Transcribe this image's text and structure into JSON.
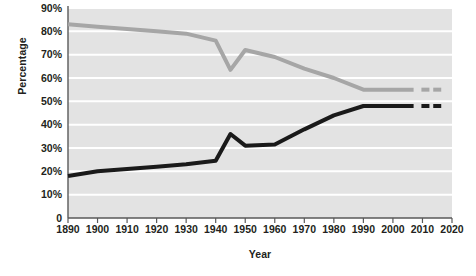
{
  "chart_data": {
    "type": "line",
    "title": "",
    "xlabel": "Year",
    "ylabel": "Percentage",
    "xlim": [
      1890,
      2020
    ],
    "ylim": [
      0,
      90
    ],
    "grid": true,
    "legend_position": "inline-labels",
    "y_ticks": [
      "0",
      "10%",
      "20%",
      "30%",
      "40%",
      "50%",
      "60%",
      "70%",
      "80%",
      "90%"
    ],
    "y_tick_values": [
      0,
      10,
      20,
      30,
      40,
      50,
      60,
      70,
      80,
      90
    ],
    "x_ticks": [
      "1890",
      "1900",
      "1910",
      "1920",
      "1930",
      "1940",
      "1950",
      "1960",
      "1970",
      "1980",
      "1990",
      "2000",
      "2010",
      "2020"
    ],
    "x_tick_values": [
      1890,
      1900,
      1910,
      1920,
      1930,
      1940,
      1950,
      1960,
      1970,
      1980,
      1990,
      2000,
      2010,
      2020
    ],
    "series": [
      {
        "name": "Men",
        "color": "#a6a6a6",
        "label_x": 1967,
        "label_y": 69,
        "x": [
          1890,
          1900,
          1910,
          1920,
          1930,
          1940,
          1945,
          1950,
          1960,
          1970,
          1980,
          1990,
          2000,
          2007
        ],
        "values": [
          83,
          82,
          81,
          80,
          79,
          76,
          63.5,
          72,
          69,
          64,
          60,
          55,
          55,
          55
        ],
        "dashes_x": [
          2011,
          2015
        ],
        "dashes_y": [
          55,
          55
        ]
      },
      {
        "name": "Women",
        "color": "#1a1a1a",
        "label_x": 1949,
        "label_y": 44,
        "x": [
          1890,
          1900,
          1910,
          1920,
          1930,
          1940,
          1945,
          1950,
          1960,
          1970,
          1980,
          1990,
          2000,
          2007
        ],
        "values": [
          18,
          20,
          21,
          22,
          23,
          24.5,
          36,
          31,
          31.5,
          38,
          44,
          48,
          48,
          48
        ],
        "dashes_x": [
          2011,
          2015
        ],
        "dashes_y": [
          48,
          48
        ]
      }
    ]
  },
  "style": {
    "plot_background": "#e3e3e3",
    "gridline_color": "#ffffff",
    "axis_color": "#595959",
    "text_color": "#231f20"
  }
}
